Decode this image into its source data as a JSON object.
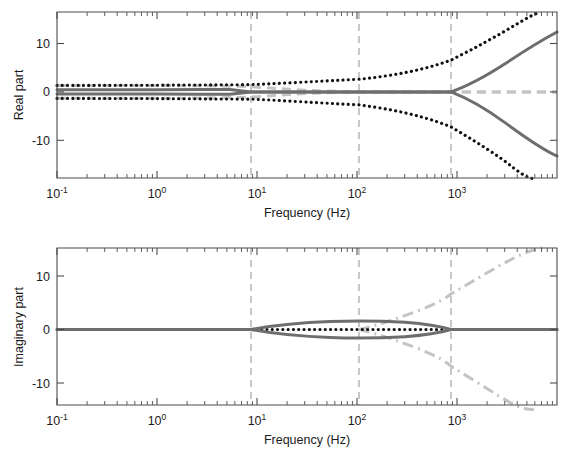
{
  "figure": {
    "background": "#ffffff",
    "panels": [
      "real-part-panel",
      "imaginary-part-panel"
    ]
  },
  "colors": {
    "solid_gray": "#6e6e6e",
    "dotted_black": "#111111",
    "dashed_light_gray": "#c4c4c4",
    "axis": "#4d4d4d",
    "guide_line": "#9a9a9a"
  },
  "chart_data": [
    {
      "type": "line",
      "id": "real-part",
      "title": "",
      "xlabel": "Frequency (Hz)",
      "ylabel": "Real part",
      "xscale": "log",
      "xlim": [
        0.1,
        7000
      ],
      "ylim": [
        -15.5,
        14.5
      ],
      "yticks": [
        10,
        0,
        -10
      ],
      "ytick_labels": [
        "10",
        "0",
        "-10"
      ],
      "xticks": [
        0.1,
        1,
        10,
        100,
        1000
      ],
      "xtick_labels": [
        "10-1",
        "100",
        "101",
        "102",
        "103"
      ],
      "grid": false,
      "legend": "none",
      "annotations": {
        "vertical_guides": [
          8.2,
          100,
          870
        ],
        "vertical_guide_style": "dashed light gray"
      },
      "series": [
        {
          "name": "eigenvalue-branch-upper-solid",
          "style": "solid",
          "color": "#6e6e6e",
          "points": [
            [
              0.1,
              0.45
            ],
            [
              1,
              0.45
            ],
            [
              4,
              0.5
            ],
            [
              6.5,
              0.45
            ],
            [
              8.2,
              0.0
            ],
            [
              20,
              0.0
            ],
            [
              100,
              0.0
            ],
            [
              400,
              0.0
            ],
            [
              870,
              0.0
            ],
            [
              1200,
              1.4
            ],
            [
              1800,
              3.1
            ],
            [
              2600,
              5.0
            ],
            [
              3600,
              7.0
            ],
            [
              5000,
              9.2
            ],
            [
              7000,
              11.3
            ]
          ]
        },
        {
          "name": "eigenvalue-branch-lower-solid",
          "style": "solid",
          "color": "#6e6e6e",
          "points": [
            [
              0.1,
              -0.45
            ],
            [
              1,
              -0.45
            ],
            [
              4,
              -0.5
            ],
            [
              6.5,
              -0.45
            ],
            [
              8.2,
              0.0
            ],
            [
              20,
              0.0
            ],
            [
              100,
              0.0
            ],
            [
              400,
              0.0
            ],
            [
              870,
              0.0
            ],
            [
              1200,
              -1.5
            ],
            [
              1800,
              -3.4
            ],
            [
              2600,
              -5.6
            ],
            [
              3600,
              -7.9
            ],
            [
              5000,
              -10.6
            ],
            [
              7000,
              -13.2
            ]
          ]
        },
        {
          "name": "eigenvalue-upper-dotted",
          "style": "dotted",
          "color": "#111111",
          "points": [
            [
              0.1,
              1.35
            ],
            [
              1,
              1.35
            ],
            [
              4,
              1.4
            ],
            [
              8.2,
              1.5
            ],
            [
              20,
              1.8
            ],
            [
              50,
              2.2
            ],
            [
              100,
              2.6
            ],
            [
              200,
              3.4
            ],
            [
              400,
              4.6
            ],
            [
              870,
              6.6
            ],
            [
              1500,
              9.1
            ],
            [
              2400,
              11.6
            ],
            [
              3400,
              13.8
            ],
            [
              4200,
              14.5
            ]
          ]
        },
        {
          "name": "eigenvalue-lower-dotted",
          "style": "dotted",
          "color": "#111111",
          "points": [
            [
              0.1,
              -1.35
            ],
            [
              1,
              -1.35
            ],
            [
              4,
              -1.4
            ],
            [
              8.2,
              -1.5
            ],
            [
              20,
              -1.8
            ],
            [
              50,
              -2.2
            ],
            [
              100,
              -2.7
            ],
            [
              200,
              -3.6
            ],
            [
              400,
              -5.0
            ],
            [
              870,
              -7.2
            ],
            [
              1500,
              -10.0
            ],
            [
              2400,
              -12.9
            ],
            [
              3200,
              -14.8
            ],
            [
              3900,
              -15.5
            ]
          ]
        },
        {
          "name": "reference-dashed-light-gray-upper",
          "style": "dashed",
          "color": "#c4c4c4",
          "points": [
            [
              0.1,
              1.35
            ],
            [
              1,
              1.35
            ],
            [
              4,
              1.3
            ],
            [
              8.2,
              1.1
            ],
            [
              20,
              0.6
            ],
            [
              60,
              0.2
            ],
            [
              120,
              0.05
            ],
            [
              400,
              0.0
            ],
            [
              870,
              0.0
            ],
            [
              2000,
              0.0
            ],
            [
              7000,
              0.0
            ]
          ]
        },
        {
          "name": "reference-dashed-light-gray-lower",
          "style": "dashed",
          "color": "#c4c4c4",
          "points": [
            [
              0.1,
              -1.35
            ],
            [
              1,
              -1.35
            ],
            [
              4,
              -1.3
            ],
            [
              8.2,
              -1.1
            ],
            [
              20,
              -0.6
            ],
            [
              60,
              -0.2
            ],
            [
              120,
              -0.05
            ],
            [
              400,
              0.0
            ],
            [
              870,
              0.0
            ],
            [
              2000,
              0.0
            ],
            [
              7000,
              0.0
            ]
          ]
        }
      ]
    },
    {
      "type": "line",
      "id": "imaginary-part",
      "title": "",
      "xlabel": "Frequency (Hz)",
      "ylabel": "Imaginary part",
      "xscale": "log",
      "xlim": [
        0.1,
        7000
      ],
      "ylim": [
        -15.5,
        14.5
      ],
      "yticks": [
        10,
        0,
        -10
      ],
      "ytick_labels": [
        "10",
        "0",
        "-10"
      ],
      "xticks": [
        0.1,
        1,
        10,
        100,
        1000
      ],
      "xtick_labels": [
        "10-1",
        "100",
        "101",
        "102",
        "103"
      ],
      "grid": false,
      "legend": "none",
      "annotations": {
        "vertical_guides": [
          8.2,
          100,
          870
        ],
        "vertical_guide_style": "dashed light gray"
      },
      "series": [
        {
          "name": "imag-branch-upper-solid",
          "style": "solid",
          "color": "#6e6e6e",
          "points": [
            [
              0.1,
              0.0
            ],
            [
              1,
              0.0
            ],
            [
              5,
              0.0
            ],
            [
              8.2,
              0.0
            ],
            [
              12,
              0.45
            ],
            [
              20,
              0.75
            ],
            [
              40,
              1.05
            ],
            [
              70,
              1.25
            ],
            [
              110,
              1.38
            ],
            [
              180,
              1.45
            ],
            [
              300,
              1.4
            ],
            [
              500,
              1.15
            ],
            [
              700,
              0.7
            ],
            [
              870,
              0.0
            ],
            [
              1500,
              0.0
            ],
            [
              3000,
              0.0
            ],
            [
              7000,
              0.0
            ]
          ]
        },
        {
          "name": "imag-branch-lower-solid",
          "style": "solid",
          "color": "#6e6e6e",
          "points": [
            [
              0.1,
              0.0
            ],
            [
              1,
              0.0
            ],
            [
              5,
              0.0
            ],
            [
              8.2,
              0.0
            ],
            [
              12,
              -0.45
            ],
            [
              20,
              -0.75
            ],
            [
              40,
              -1.05
            ],
            [
              70,
              -1.25
            ],
            [
              110,
              -1.38
            ],
            [
              180,
              -1.45
            ],
            [
              300,
              -1.4
            ],
            [
              500,
              -1.15
            ],
            [
              700,
              -0.7
            ],
            [
              870,
              0.0
            ],
            [
              1500,
              0.0
            ],
            [
              3000,
              0.0
            ],
            [
              7000,
              0.0
            ]
          ]
        },
        {
          "name": "imag-zero-dotted",
          "style": "dotted",
          "color": "#111111",
          "points": [
            [
              8.2,
              0.0
            ],
            [
              30,
              0.0
            ],
            [
              100,
              0.0
            ],
            [
              300,
              0.0
            ],
            [
              600,
              0.0
            ],
            [
              870,
              0.0
            ]
          ]
        },
        {
          "name": "imag-upper-dashdot",
          "style": "dashdot",
          "color": "#c4c4c4",
          "points": [
            [
              100,
              0.0
            ],
            [
              160,
              0.9
            ],
            [
              260,
              2.3
            ],
            [
              400,
              4.0
            ],
            [
              600,
              5.9
            ],
            [
              870,
              7.9
            ],
            [
              1300,
              10.2
            ],
            [
              1900,
              12.5
            ],
            [
              2600,
              14.2
            ],
            [
              3100,
              14.5
            ]
          ]
        },
        {
          "name": "imag-lower-dashdot",
          "style": "dashdot",
          "color": "#c4c4c4",
          "points": [
            [
              100,
              0.0
            ],
            [
              160,
              -0.9
            ],
            [
              260,
              -2.4
            ],
            [
              400,
              -4.2
            ],
            [
              600,
              -6.2
            ],
            [
              870,
              -8.4
            ],
            [
              1300,
              -10.9
            ],
            [
              1900,
              -13.4
            ],
            [
              2500,
              -15.2
            ],
            [
              2900,
              -15.5
            ]
          ]
        }
      ]
    }
  ]
}
